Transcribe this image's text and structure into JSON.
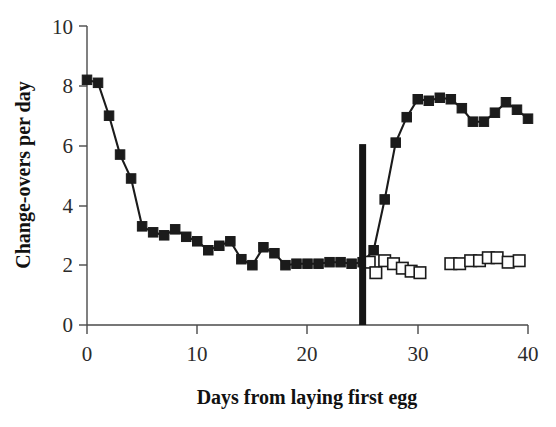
{
  "chart_data": {
    "type": "line",
    "title": "",
    "subtitle": "",
    "xlabel": "Days from laying first egg",
    "ylabel": "Change-overs per day",
    "xlim": [
      0,
      40
    ],
    "ylim": [
      0,
      10
    ],
    "xticks": [
      0,
      10,
      20,
      30,
      40
    ],
    "yticks": [
      0,
      2,
      4,
      6,
      8,
      10
    ],
    "xticklabels": [
      "0",
      "10",
      "20",
      "30",
      "40"
    ],
    "yticklabels": [
      "0",
      "2",
      "4",
      "6",
      "8",
      "10"
    ],
    "grid": false,
    "legend": "none",
    "annotations": [
      {
        "name": "experimental-manipulation-marker",
        "type": "vertical-bar",
        "x": 25,
        "y_from": 0,
        "y_to": 6.05,
        "color": "#151515",
        "label": ""
      }
    ],
    "series": [
      {
        "name": "filled-squares",
        "marker": "filled-square",
        "color": "#1b1b1b",
        "connected": true,
        "x": [
          0,
          1,
          2,
          3,
          4,
          5,
          6,
          7,
          8,
          9,
          10,
          11,
          12,
          13,
          14,
          15,
          16,
          17,
          18,
          19,
          20,
          21,
          22,
          23,
          24,
          25,
          26,
          27,
          28,
          29,
          30,
          31,
          32,
          33,
          34,
          35,
          36,
          37,
          38,
          39,
          40
        ],
        "y": [
          8.2,
          8.1,
          7.0,
          5.7,
          4.9,
          3.3,
          3.1,
          3.0,
          3.2,
          2.95,
          2.8,
          2.5,
          2.65,
          2.8,
          2.2,
          2.0,
          2.6,
          2.4,
          2.0,
          2.05,
          2.05,
          2.05,
          2.1,
          2.1,
          2.05,
          2.1,
          2.5,
          4.2,
          6.1,
          6.95,
          7.55,
          7.5,
          7.6,
          7.55,
          7.25,
          6.8,
          6.8,
          7.1,
          7.45,
          7.2,
          6.9
        ]
      },
      {
        "name": "open-squares",
        "marker": "open-square",
        "color": "#1b1b1b",
        "connected": false,
        "x": [
          25.6,
          26.2,
          27,
          27.8,
          28.6,
          29.4,
          30.2,
          33,
          33.8,
          34.8,
          35.6,
          36.4,
          37.2,
          38.2,
          39.2
        ],
        "y": [
          2.1,
          1.75,
          2.15,
          2.05,
          1.9,
          1.8,
          1.75,
          2.05,
          2.05,
          2.15,
          2.15,
          2.25,
          2.25,
          2.1,
          2.15
        ]
      }
    ]
  },
  "axes": {
    "x_label": "Days from laying first egg",
    "y_label": "Change-overs per day"
  }
}
